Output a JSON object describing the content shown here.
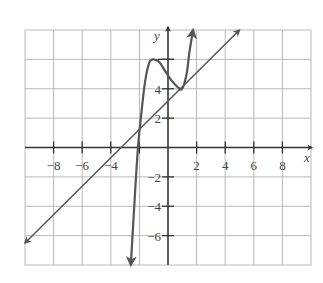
{
  "chart_data": {
    "type": "line",
    "title": "",
    "xlabel": "x",
    "ylabel": "y",
    "xlim": [
      -10,
      10
    ],
    "ylim": [
      -8,
      8
    ],
    "grid": true,
    "grid_step": 2,
    "x_ticks": [
      -8,
      -6,
      -4,
      -2,
      2,
      4,
      6,
      8
    ],
    "x_tick_labels": [
      "−8",
      "−6",
      "−4",
      "",
      "2",
      "4",
      "6",
      "8"
    ],
    "y_ticks": [
      -6,
      -4,
      -2,
      2,
      4,
      6
    ],
    "y_tick_labels": [
      "−6",
      "−4",
      "−2",
      "2",
      "4",
      ""
    ],
    "series": [
      {
        "name": "line",
        "description": "straight line y = x + 3, arrows both ends",
        "x": [
          -10,
          5
        ],
        "y": [
          -6.5,
          8
        ]
      },
      {
        "name": "curve",
        "description": "polynomial-like curve with local max near (-1,6), touching line at (1,4), arrows both ends",
        "x": [
          -2.6,
          -2.3,
          -2.1,
          -1.9,
          -1.6,
          -1.3,
          -1.0,
          -0.6,
          -0.2,
          0.3,
          0.7,
          1.0,
          1.3,
          1.5,
          1.75
        ],
        "y": [
          -8,
          -3,
          0,
          2,
          4.5,
          5.8,
          6.0,
          5.8,
          5.2,
          4.5,
          4.1,
          4.0,
          5.0,
          6.5,
          8
        ]
      }
    ]
  },
  "labels": {
    "x_axis": "x",
    "y_axis": "y"
  },
  "colors": {
    "grid": "#b8b8b8",
    "axis": "#333333",
    "curve": "#555555",
    "line": "#555555"
  }
}
